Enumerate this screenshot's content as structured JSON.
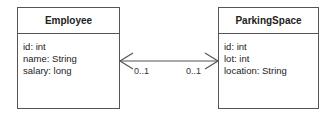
{
  "diagram": {
    "type": "UML class diagram",
    "classes": [
      {
        "name": "Employee",
        "attributes": [
          "id: int",
          "name: String",
          "salary: long"
        ]
      },
      {
        "name": "ParkingSpace",
        "attributes": [
          "id: int",
          "lot: int",
          "location: String"
        ]
      }
    ],
    "association": {
      "navigability": "bidirectional",
      "multiplicity_employee_end": "0..1",
      "multiplicity_parking_end": "0..1"
    },
    "colors": {
      "line": "#555555",
      "text": "#222222",
      "background": "#ffffff"
    }
  }
}
